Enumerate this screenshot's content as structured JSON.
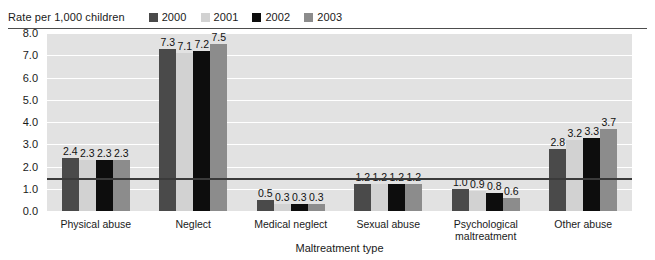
{
  "header": {
    "unit_label": "Rate per 1,000 children"
  },
  "legend": {
    "position": "top-right",
    "items": [
      {
        "label": "2000",
        "color": "#4a4a4a"
      },
      {
        "label": "2001",
        "color": "#d2d2d2"
      },
      {
        "label": "2002",
        "color": "#0d0d0d"
      },
      {
        "label": "2003",
        "color": "#8c8c8c"
      }
    ]
  },
  "colors": {
    "plot_background": "#e2e2e2",
    "gridline": "#ffffff",
    "axis": "#3a3a3a",
    "text": "#1a1a1a",
    "page_background": "#ffffff"
  },
  "chart_data": {
    "type": "bar",
    "title": "",
    "subtitle": "",
    "xlabel": "Maltreatment type",
    "ylabel": "Rate per 1,000 children",
    "ylim": [
      0,
      8
    ],
    "yticks": [
      "0.0",
      "1.0",
      "2.0",
      "3.0",
      "4.0",
      "5.0",
      "6.0",
      "7.0",
      "8.0"
    ],
    "ytick_values": [
      0,
      1,
      2,
      3,
      4,
      5,
      6,
      7,
      8
    ],
    "grid": true,
    "legend_position": "top-right",
    "categories": [
      "Physical abuse",
      "Neglect",
      "Medical neglect",
      "Sexual abuse",
      "Psychological maltreatment",
      "Other abuse"
    ],
    "series": [
      {
        "name": "2000",
        "color": "#4a4a4a",
        "values": [
          2.4,
          7.3,
          0.5,
          1.2,
          1.0,
          2.8
        ]
      },
      {
        "name": "2001",
        "color": "#d2d2d2",
        "values": [
          2.3,
          7.1,
          0.3,
          1.2,
          0.9,
          3.2
        ]
      },
      {
        "name": "2002",
        "color": "#0d0d0d",
        "values": [
          2.3,
          7.2,
          0.3,
          1.2,
          0.8,
          3.3
        ]
      },
      {
        "name": "2003",
        "color": "#8c8c8c",
        "values": [
          2.3,
          7.5,
          0.3,
          1.2,
          0.6,
          3.7
        ]
      }
    ],
    "value_labels": [
      [
        "2.4",
        "2.3",
        "2.3",
        "2.3"
      ],
      [
        "7.3",
        "7.1",
        "7.2",
        "7.5"
      ],
      [
        "0.5",
        "0.3",
        "0.3",
        "0.3"
      ],
      [
        "1.2",
        "1.2",
        "1.2",
        "1.2"
      ],
      [
        "1.0",
        "0.9",
        "0.8",
        "0.6"
      ],
      [
        "2.8",
        "3.2",
        "3.3",
        "3.7"
      ]
    ]
  }
}
